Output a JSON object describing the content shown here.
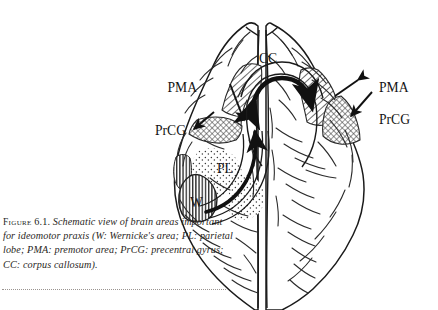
{
  "figure": {
    "label": "Figure",
    "number": "6.1.",
    "caption_text": "Schematic view of brain areas important for ideomotor praxis (W: Wernicke's area; PL: parietal lobe; PMA: premotor area; PrCG: precentral gyrus; CC: corpus callosum).",
    "view": "Superior (top-down) schematic view of the human cerebrum"
  },
  "colors": {
    "background": "#ffffff",
    "ink": "#141414",
    "outline": "#1a1a1a",
    "sulci": "#2b2b2b",
    "caption_text": "#2a2724",
    "rule": "#9a9490",
    "hatch": "#3a3a3a"
  },
  "labels": {
    "pma_left": "PMA",
    "pma_right": "PMA",
    "prcg_left": "PrCG",
    "prcg_right": "PrCG",
    "pl": "PL",
    "w": "W",
    "cc": "CC"
  },
  "regions": [
    {
      "id": "pma-left",
      "abbr": "PMA",
      "name": "premotor area",
      "hemisphere": "left",
      "fill": "diagonal-hatch"
    },
    {
      "id": "pma-right",
      "abbr": "PMA",
      "name": "premotor area",
      "hemisphere": "right",
      "fill": "diagonal-hatch"
    },
    {
      "id": "prcg-left",
      "abbr": "PrCG",
      "name": "precentral gyrus",
      "hemisphere": "left",
      "fill": "cross-hatch"
    },
    {
      "id": "prcg-right",
      "abbr": "PrCG",
      "name": "precentral gyrus",
      "hemisphere": "right",
      "fill": "cross-hatch"
    },
    {
      "id": "pl",
      "abbr": "PL",
      "name": "parietal lobe",
      "hemisphere": "left",
      "fill": "stipple"
    },
    {
      "id": "w",
      "abbr": "W",
      "name": "Wernicke's area",
      "hemisphere": "left",
      "fill": "vertical-hatch"
    }
  ],
  "connections": [
    {
      "id": "cc-arrow",
      "abbr": "CC",
      "name": "corpus callosum",
      "style": "thick double-headed arc"
    },
    {
      "id": "arcuate-arrow",
      "abbr": "",
      "name": "arcuate fasciculus",
      "style": "long curved arrow, Wernicke to premotor"
    },
    {
      "id": "pma-left-pointer",
      "name": "PMA left label pointer",
      "style": "arrow"
    },
    {
      "id": "pma-right-pointer",
      "name": "PMA right label pointer",
      "style": "arrow"
    },
    {
      "id": "prcg-left-pointer",
      "name": "PrCG left label pointer",
      "style": "arrow"
    },
    {
      "id": "prcg-right-pointer",
      "name": "PrCG right label pointer",
      "style": "arrow"
    }
  ]
}
